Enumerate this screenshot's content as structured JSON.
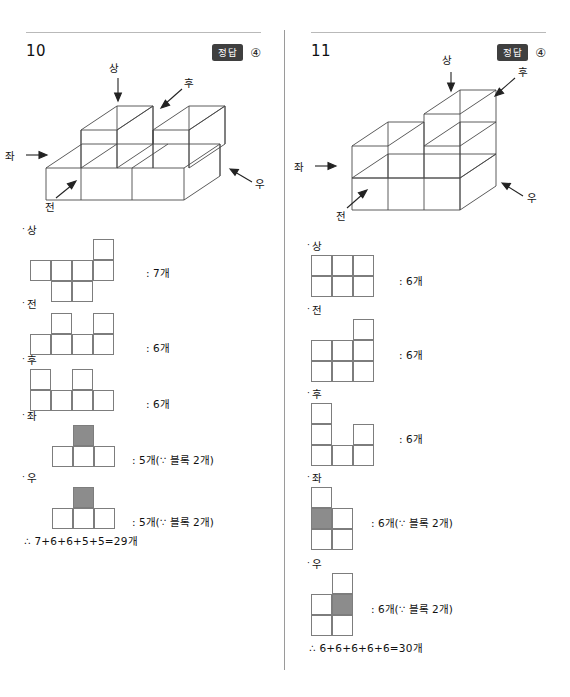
{
  "meta": {
    "answer_badge_label": "정답",
    "shade_color": "#8c8c8c",
    "line_color": "#7d7d7d"
  },
  "columns": [
    {
      "id": "problem-10",
      "number": "10",
      "answer_mark": "④",
      "figure": {
        "direction_labels": {
          "top": "상",
          "rear": "후",
          "left": "좌",
          "right": "우",
          "front": "전"
        }
      },
      "views": [
        {
          "id": "top",
          "label": "상",
          "count_text": ": 7개",
          "cols": 4,
          "rows": 3,
          "cells": [
            {
              "c": 4,
              "r": 1,
              "shaded": false
            },
            {
              "c": 1,
              "r": 2,
              "shaded": false
            },
            {
              "c": 2,
              "r": 2,
              "shaded": false
            },
            {
              "c": 3,
              "r": 2,
              "shaded": false
            },
            {
              "c": 4,
              "r": 2,
              "shaded": false
            },
            {
              "c": 2,
              "r": 3,
              "shaded": false
            },
            {
              "c": 3,
              "r": 3,
              "shaded": false
            }
          ]
        },
        {
          "id": "front",
          "label": "전",
          "count_text": ": 6개",
          "cols": 4,
          "rows": 2,
          "cells": [
            {
              "c": 2,
              "r": 1,
              "shaded": false
            },
            {
              "c": 4,
              "r": 1,
              "shaded": false
            },
            {
              "c": 1,
              "r": 2,
              "shaded": false
            },
            {
              "c": 2,
              "r": 2,
              "shaded": false
            },
            {
              "c": 3,
              "r": 2,
              "shaded": false
            },
            {
              "c": 4,
              "r": 2,
              "shaded": false
            }
          ]
        },
        {
          "id": "rear",
          "label": "후",
          "count_text": ": 6개",
          "cols": 4,
          "rows": 2,
          "cells": [
            {
              "c": 1,
              "r": 1,
              "shaded": false
            },
            {
              "c": 3,
              "r": 1,
              "shaded": false
            },
            {
              "c": 1,
              "r": 2,
              "shaded": false
            },
            {
              "c": 2,
              "r": 2,
              "shaded": false
            },
            {
              "c": 3,
              "r": 2,
              "shaded": false
            },
            {
              "c": 4,
              "r": 2,
              "shaded": false
            }
          ]
        },
        {
          "id": "left",
          "label": "좌",
          "count_text": ": 5개(∵ 블록 2개)",
          "cols": 3,
          "rows": 2,
          "cells": [
            {
              "c": 2,
              "r": 1,
              "shaded": true
            },
            {
              "c": 1,
              "r": 2,
              "shaded": false
            },
            {
              "c": 2,
              "r": 2,
              "shaded": false
            },
            {
              "c": 3,
              "r": 2,
              "shaded": false
            }
          ]
        },
        {
          "id": "right",
          "label": "우",
          "count_text": ": 5개(∵ 블록 2개)",
          "cols": 3,
          "rows": 2,
          "cells": [
            {
              "c": 2,
              "r": 1,
              "shaded": true
            },
            {
              "c": 1,
              "r": 2,
              "shaded": false
            },
            {
              "c": 2,
              "r": 2,
              "shaded": false
            },
            {
              "c": 3,
              "r": 2,
              "shaded": false
            }
          ]
        }
      ],
      "conclusion": "∴ 7+6+6+5+5=29개"
    },
    {
      "id": "problem-11",
      "number": "11",
      "answer_mark": "④",
      "figure": {
        "direction_labels": {
          "top": "상",
          "rear": "후",
          "left": "좌",
          "right": "우",
          "front": "전"
        }
      },
      "views": [
        {
          "id": "top",
          "label": "상",
          "count_text": ": 6개",
          "cols": 3,
          "rows": 2,
          "cells": [
            {
              "c": 1,
              "r": 1,
              "shaded": false
            },
            {
              "c": 2,
              "r": 1,
              "shaded": false
            },
            {
              "c": 3,
              "r": 1,
              "shaded": false
            },
            {
              "c": 1,
              "r": 2,
              "shaded": false
            },
            {
              "c": 2,
              "r": 2,
              "shaded": false
            },
            {
              "c": 3,
              "r": 2,
              "shaded": false
            }
          ]
        },
        {
          "id": "front",
          "label": "전",
          "count_text": ": 6개",
          "cols": 3,
          "rows": 3,
          "cells": [
            {
              "c": 3,
              "r": 1,
              "shaded": false
            },
            {
              "c": 1,
              "r": 2,
              "shaded": false
            },
            {
              "c": 2,
              "r": 2,
              "shaded": false
            },
            {
              "c": 3,
              "r": 2,
              "shaded": false
            },
            {
              "c": 1,
              "r": 3,
              "shaded": false
            },
            {
              "c": 2,
              "r": 3,
              "shaded": false
            },
            {
              "c": 3,
              "r": 3,
              "shaded": false
            }
          ]
        },
        {
          "id": "rear",
          "label": "후",
          "count_text": ": 6개",
          "cols": 3,
          "rows": 3,
          "cells": [
            {
              "c": 1,
              "r": 1,
              "shaded": false
            },
            {
              "c": 1,
              "r": 2,
              "shaded": false
            },
            {
              "c": 3,
              "r": 2,
              "shaded": false
            },
            {
              "c": 1,
              "r": 3,
              "shaded": false
            },
            {
              "c": 2,
              "r": 3,
              "shaded": false
            },
            {
              "c": 3,
              "r": 3,
              "shaded": false
            }
          ]
        },
        {
          "id": "left",
          "label": "좌",
          "count_text": ": 6개(∵ 블록 2개)",
          "cols": 2,
          "rows": 3,
          "cells": [
            {
              "c": 1,
              "r": 1,
              "shaded": false
            },
            {
              "c": 1,
              "r": 2,
              "shaded": true
            },
            {
              "c": 2,
              "r": 2,
              "shaded": false
            },
            {
              "c": 1,
              "r": 3,
              "shaded": false
            },
            {
              "c": 2,
              "r": 3,
              "shaded": false
            }
          ]
        },
        {
          "id": "right",
          "label": "우",
          "count_text": ": 6개(∵ 블록 2개)",
          "cols": 2,
          "rows": 3,
          "cells": [
            {
              "c": 2,
              "r": 1,
              "shaded": false
            },
            {
              "c": 1,
              "r": 2,
              "shaded": false
            },
            {
              "c": 2,
              "r": 2,
              "shaded": true
            },
            {
              "c": 1,
              "r": 3,
              "shaded": false
            },
            {
              "c": 2,
              "r": 3,
              "shaded": false
            }
          ]
        }
      ],
      "conclusion": "∴ 6+6+6+6+6=30개"
    }
  ]
}
